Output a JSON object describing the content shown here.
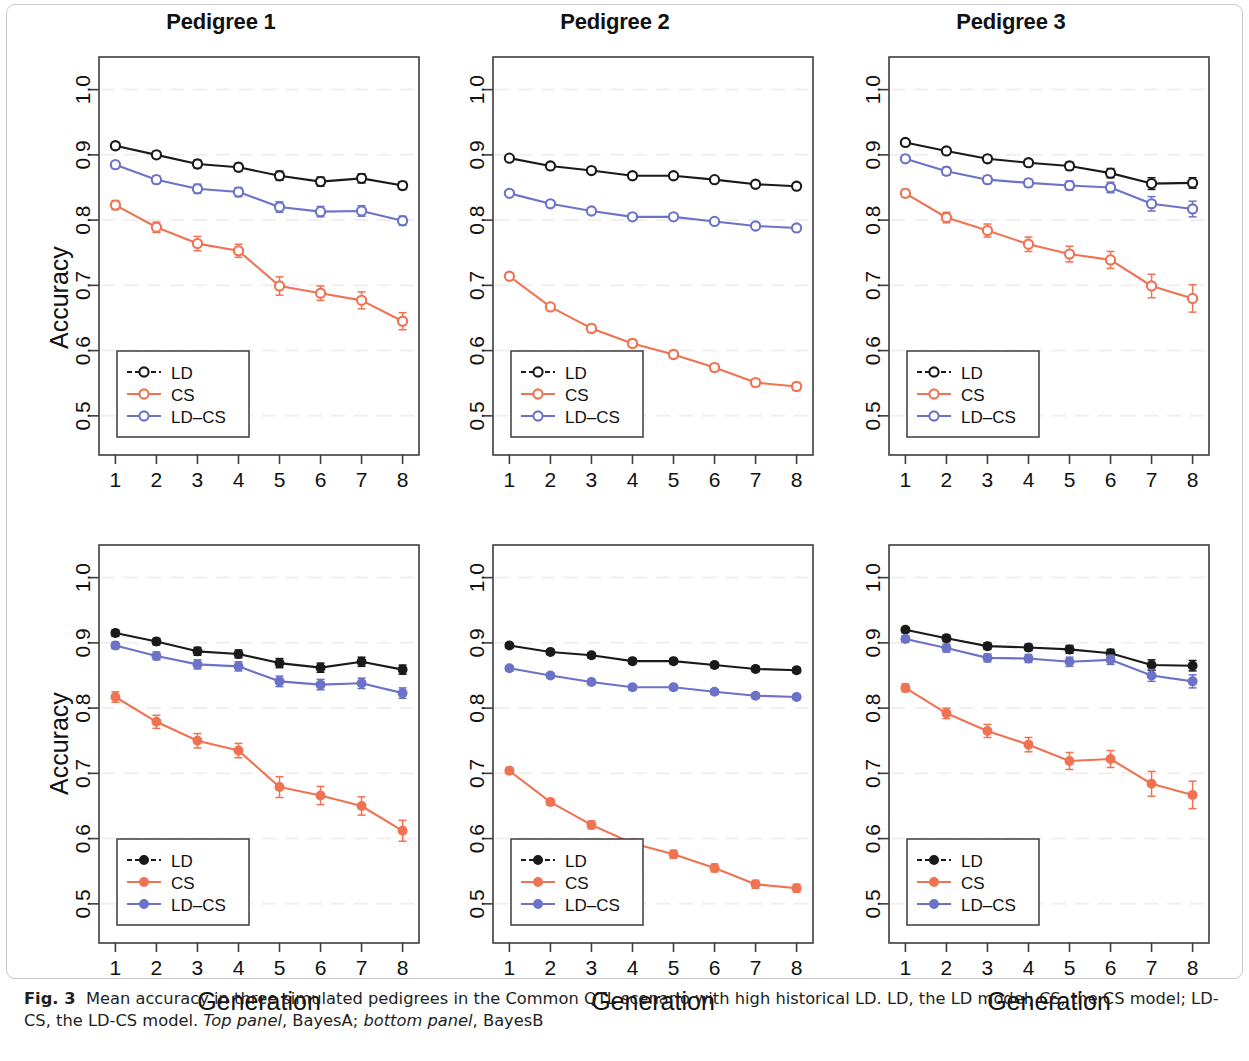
{
  "figure": {
    "label": "Fig. 3",
    "caption_part1": "Mean accuracy in three simulated pedigrees in the Common QTL scenario with high historical LD. LD, the LD model; CS, the CS model; LD-CS, the LD-CS model. ",
    "caption_em1": "Top panel",
    "caption_part2": ", BayesA; ",
    "caption_em2": "bottom panel",
    "caption_part3": ", BayesB"
  },
  "colors": {
    "ld": "#1a1a1a",
    "cs": "#ef7252",
    "ldcs": "#6b72c8",
    "axis": "#3d3d3d",
    "grid": "#f2eef0"
  },
  "axes": {
    "ylabel": "Accuracy",
    "xlabel": "Generation",
    "yticks": [
      0.5,
      0.6,
      0.7,
      0.8,
      0.9,
      1.0
    ],
    "ytick_labels": [
      "0.5",
      "0.6",
      "0.7",
      "0.8",
      "0.9",
      "1.0"
    ],
    "xticks": [
      1,
      2,
      3,
      4,
      5,
      6,
      7,
      8
    ],
    "xtick_labels": [
      "1",
      "2",
      "3",
      "4",
      "5",
      "6",
      "7",
      "8"
    ],
    "ylim": [
      0.44,
      1.05
    ],
    "xlim": [
      0.6,
      8.4
    ]
  },
  "legend": {
    "entries": [
      "LD",
      "CS",
      "LD-CS"
    ],
    "position": "bottom-left"
  },
  "chart_data": [
    {
      "type": "line",
      "panel_index": 0,
      "row": "top",
      "model": "BayesA",
      "title": "Pedigree 1",
      "xlabel": "Generation",
      "ylabel": "Accuracy",
      "x": [
        1,
        2,
        3,
        4,
        5,
        6,
        7,
        8
      ],
      "ylim": [
        0.44,
        1.05
      ],
      "marker": "open-circle",
      "series": [
        {
          "name": "LD",
          "values": [
            0.914,
            0.9,
            0.886,
            0.881,
            0.868,
            0.859,
            0.864,
            0.853
          ],
          "errors": [
            0.005,
            0.005,
            0.006,
            0.006,
            0.007,
            0.007,
            0.007,
            0.006
          ]
        },
        {
          "name": "CS",
          "values": [
            0.823,
            0.789,
            0.764,
            0.753,
            0.699,
            0.688,
            0.677,
            0.645
          ],
          "errors": [
            0.007,
            0.008,
            0.011,
            0.01,
            0.014,
            0.011,
            0.013,
            0.013
          ]
        },
        {
          "name": "LD-CS",
          "values": [
            0.885,
            0.862,
            0.848,
            0.843,
            0.82,
            0.813,
            0.814,
            0.799
          ],
          "errors": [
            0.005,
            0.006,
            0.007,
            0.007,
            0.008,
            0.008,
            0.008,
            0.007
          ]
        }
      ]
    },
    {
      "type": "line",
      "panel_index": 1,
      "row": "top",
      "model": "BayesA",
      "title": "Pedigree 2",
      "xlabel": "Generation",
      "ylabel": "Accuracy",
      "x": [
        1,
        2,
        3,
        4,
        5,
        6,
        7,
        8
      ],
      "ylim": [
        0.44,
        1.05
      ],
      "marker": "open-circle",
      "series": [
        {
          "name": "LD",
          "values": [
            0.895,
            0.883,
            0.876,
            0.868,
            0.868,
            0.862,
            0.855,
            0.852
          ],
          "errors": [
            0.004,
            0.004,
            0.004,
            0.004,
            0.004,
            0.004,
            0.004,
            0.004
          ]
        },
        {
          "name": "CS",
          "values": [
            0.714,
            0.667,
            0.634,
            0.611,
            0.594,
            0.574,
            0.551,
            0.545
          ],
          "errors": [
            0.005,
            0.005,
            0.006,
            0.006,
            0.006,
            0.006,
            0.006,
            0.006
          ]
        },
        {
          "name": "LD-CS",
          "values": [
            0.841,
            0.825,
            0.814,
            0.805,
            0.805,
            0.798,
            0.791,
            0.788
          ],
          "errors": [
            0.004,
            0.004,
            0.004,
            0.004,
            0.004,
            0.004,
            0.004,
            0.004
          ]
        }
      ]
    },
    {
      "type": "line",
      "panel_index": 2,
      "row": "top",
      "model": "BayesA",
      "title": "Pedigree 3",
      "xlabel": "Generation",
      "ylabel": "Accuracy",
      "x": [
        1,
        2,
        3,
        4,
        5,
        6,
        7,
        8
      ],
      "ylim": [
        0.44,
        1.05
      ],
      "marker": "open-circle",
      "series": [
        {
          "name": "LD",
          "values": [
            0.919,
            0.906,
            0.894,
            0.888,
            0.883,
            0.872,
            0.856,
            0.857
          ],
          "errors": [
            0.004,
            0.005,
            0.005,
            0.005,
            0.006,
            0.007,
            0.009,
            0.008
          ]
        },
        {
          "name": "CS",
          "values": [
            0.841,
            0.804,
            0.784,
            0.763,
            0.748,
            0.739,
            0.699,
            0.68
          ],
          "errors": [
            0.006,
            0.008,
            0.01,
            0.011,
            0.012,
            0.013,
            0.018,
            0.021
          ]
        },
        {
          "name": "LD-CS",
          "values": [
            0.894,
            0.875,
            0.862,
            0.857,
            0.853,
            0.85,
            0.825,
            0.817
          ],
          "errors": [
            0.005,
            0.006,
            0.006,
            0.006,
            0.007,
            0.008,
            0.011,
            0.012
          ]
        }
      ]
    },
    {
      "type": "line",
      "panel_index": 3,
      "row": "bottom",
      "model": "BayesB",
      "title": "",
      "xlabel": "Generation",
      "ylabel": "Accuracy",
      "x": [
        1,
        2,
        3,
        4,
        5,
        6,
        7,
        8
      ],
      "ylim": [
        0.44,
        1.05
      ],
      "marker": "filled-circle",
      "series": [
        {
          "name": "LD",
          "values": [
            0.915,
            0.902,
            0.887,
            0.883,
            0.869,
            0.862,
            0.871,
            0.859
          ],
          "errors": [
            0.005,
            0.005,
            0.006,
            0.006,
            0.007,
            0.007,
            0.007,
            0.007
          ]
        },
        {
          "name": "CS",
          "values": [
            0.817,
            0.779,
            0.75,
            0.735,
            0.679,
            0.666,
            0.65,
            0.612
          ],
          "errors": [
            0.008,
            0.01,
            0.011,
            0.011,
            0.016,
            0.014,
            0.014,
            0.016
          ]
        },
        {
          "name": "LD-CS",
          "values": [
            0.896,
            0.88,
            0.867,
            0.864,
            0.841,
            0.836,
            0.838,
            0.823
          ],
          "errors": [
            0.005,
            0.006,
            0.007,
            0.007,
            0.008,
            0.008,
            0.008,
            0.008
          ]
        }
      ]
    },
    {
      "type": "line",
      "panel_index": 4,
      "row": "bottom",
      "model": "BayesB",
      "title": "",
      "xlabel": "Generation",
      "ylabel": "Accuracy",
      "x": [
        1,
        2,
        3,
        4,
        5,
        6,
        7,
        8
      ],
      "ylim": [
        0.44,
        1.05
      ],
      "marker": "filled-circle",
      "series": [
        {
          "name": "LD",
          "values": [
            0.896,
            0.886,
            0.881,
            0.872,
            0.872,
            0.866,
            0.86,
            0.858
          ],
          "errors": [
            0.004,
            0.004,
            0.004,
            0.004,
            0.004,
            0.004,
            0.004,
            0.004
          ]
        },
        {
          "name": "CS",
          "values": [
            0.704,
            0.656,
            0.621,
            0.593,
            0.576,
            0.555,
            0.53,
            0.524
          ],
          "errors": [
            0.005,
            0.005,
            0.006,
            0.006,
            0.006,
            0.006,
            0.006,
            0.006
          ]
        },
        {
          "name": "LD-CS",
          "values": [
            0.861,
            0.85,
            0.84,
            0.832,
            0.832,
            0.825,
            0.819,
            0.817
          ],
          "errors": [
            0.004,
            0.004,
            0.004,
            0.004,
            0.004,
            0.004,
            0.004,
            0.004
          ]
        }
      ]
    },
    {
      "type": "line",
      "panel_index": 5,
      "row": "bottom",
      "model": "BayesB",
      "title": "",
      "xlabel": "Generation",
      "ylabel": "Accuracy",
      "x": [
        1,
        2,
        3,
        4,
        5,
        6,
        7,
        8
      ],
      "ylim": [
        0.44,
        1.05
      ],
      "marker": "filled-circle",
      "series": [
        {
          "name": "LD",
          "values": [
            0.92,
            0.907,
            0.895,
            0.893,
            0.89,
            0.884,
            0.866,
            0.865
          ],
          "errors": [
            0.004,
            0.005,
            0.005,
            0.005,
            0.006,
            0.006,
            0.008,
            0.008
          ]
        },
        {
          "name": "CS",
          "values": [
            0.831,
            0.792,
            0.765,
            0.744,
            0.719,
            0.722,
            0.684,
            0.667
          ],
          "errors": [
            0.006,
            0.008,
            0.01,
            0.011,
            0.013,
            0.013,
            0.019,
            0.021
          ]
        },
        {
          "name": "LD-CS",
          "values": [
            0.906,
            0.892,
            0.877,
            0.876,
            0.871,
            0.874,
            0.85,
            0.841
          ],
          "errors": [
            0.005,
            0.006,
            0.006,
            0.006,
            0.007,
            0.007,
            0.009,
            0.01
          ]
        }
      ]
    }
  ]
}
